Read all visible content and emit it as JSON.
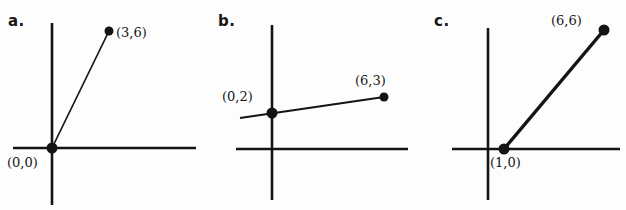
{
  "figure": {
    "title": "",
    "background_color": "#fdfdfd",
    "ink_color": "#141414",
    "panels": [
      {
        "id": "a",
        "letter": "a.",
        "letter_x": 8,
        "letter_y": 14,
        "origin_x": 52,
        "origin_y": 148,
        "x_axis": {
          "x1": 13,
          "x2": 196,
          "y": 148
        },
        "y_axis": {
          "y1": 23,
          "y2": 205,
          "x": 52
        },
        "segment": {
          "x1": 52,
          "y1": 148,
          "x2": 109,
          "y2": 31
        },
        "points": [
          {
            "name": "origin-point",
            "label": "(0,0)",
            "coords": [
              0,
              0
            ],
            "px": 52,
            "py": 148,
            "label_x": 7,
            "label_y": 156,
            "radius": 5.5
          },
          {
            "name": "endpoint",
            "label": "(3,6)",
            "coords": [
              3,
              6
            ],
            "px": 109,
            "py": 31,
            "label_x": 116,
            "label_y": 26,
            "radius": 4.5
          }
        ]
      },
      {
        "id": "b",
        "letter": "b.",
        "letter_x": 218,
        "letter_y": 14,
        "origin_x": 272,
        "origin_y": 149,
        "x_axis": {
          "x1": 236,
          "x2": 408,
          "y": 149
        },
        "y_axis": {
          "y1": 25,
          "y2": 200,
          "x": 272
        },
        "segment": {
          "x1": 240,
          "y1": 118,
          "x2": 384,
          "y2": 97
        },
        "points": [
          {
            "name": "y-intercept-point",
            "label": "(0,2)",
            "coords": [
              0,
              2
            ],
            "px": 272,
            "py": 113,
            "label_x": 222,
            "label_y": 90,
            "radius": 5.5
          },
          {
            "name": "endpoint",
            "label": "(6,3)",
            "coords": [
              6,
              3
            ],
            "px": 384,
            "py": 97,
            "label_x": 355,
            "label_y": 74,
            "radius": 4.5
          }
        ]
      },
      {
        "id": "c",
        "letter": "c.",
        "letter_x": 434,
        "letter_y": 14,
        "origin_x": 488,
        "origin_y": 149,
        "x_axis": {
          "x1": 452,
          "x2": 620,
          "y": 149
        },
        "y_axis": {
          "y1": 28,
          "y2": 200,
          "x": 488
        },
        "segment": {
          "x1": 504,
          "y1": 149,
          "x2": 604,
          "y2": 30
        },
        "points": [
          {
            "name": "x-intercept-point",
            "label": "(1,0)",
            "coords": [
              1,
              0
            ],
            "px": 504,
            "py": 149,
            "label_x": 490,
            "label_y": 156,
            "radius": 5.5
          },
          {
            "name": "endpoint",
            "label": "(6,6)",
            "coords": [
              6,
              6
            ],
            "px": 604,
            "py": 30,
            "label_x": 551,
            "label_y": 14,
            "radius": 5.5
          }
        ]
      }
    ]
  }
}
